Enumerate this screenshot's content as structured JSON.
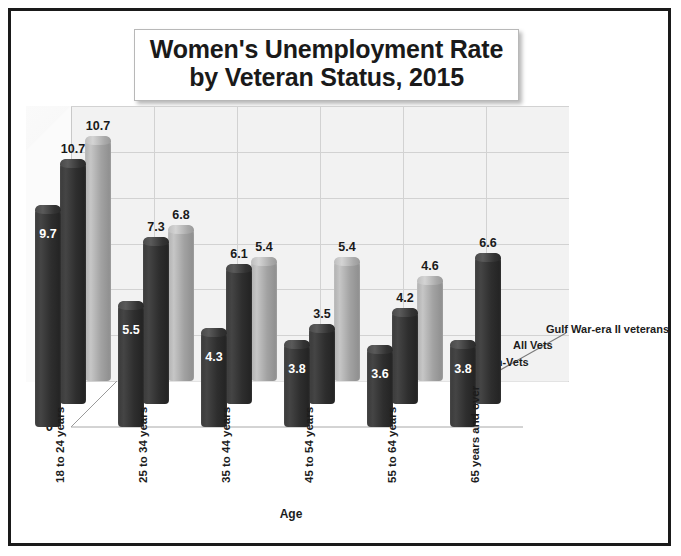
{
  "title": {
    "line1": "Women's Unemployment Rate",
    "line2": "by Veteran Status, 2015"
  },
  "axes": {
    "y_label": "Percent",
    "x_label": "Age",
    "y_ticks": [
      "0",
      "2",
      "4",
      "6",
      "8",
      "10",
      "12"
    ]
  },
  "series_axis_labels": [
    "Non-Vets",
    "All Vets",
    "Gulf War-era II veterans"
  ],
  "chart_data": {
    "type": "bar",
    "title": "Women's Unemployment Rate by Veteran Status, 2015",
    "xlabel": "Age",
    "ylabel": "Percent",
    "ylim": [
      0,
      12
    ],
    "ytick_step": 2,
    "grid": true,
    "three_d": true,
    "legend_position": "depth-axis-right",
    "categories": [
      "18 to 24 years",
      "25 to 34 years",
      "35 to 44 years",
      "45 to 54 years",
      "55 to 64 years",
      "65 years and over"
    ],
    "series": [
      {
        "name": "Non-Vets",
        "color": "#333333",
        "values": [
          9.7,
          5.5,
          4.3,
          3.8,
          3.6,
          3.8
        ]
      },
      {
        "name": "All Vets",
        "color": "#333333",
        "values": [
          10.7,
          7.3,
          6.1,
          3.5,
          4.2,
          6.6
        ]
      },
      {
        "name": "Gulf War-era II veterans",
        "color": "#b0b0b0",
        "values": [
          10.7,
          6.8,
          5.4,
          5.4,
          4.6,
          null
        ]
      }
    ]
  },
  "colors": {
    "bar_dark": "#333333",
    "bar_light": "#b0b0b0",
    "frame": "#1a1a1a",
    "wall": "#f2f2f2",
    "grid": "#d2d2d2"
  }
}
